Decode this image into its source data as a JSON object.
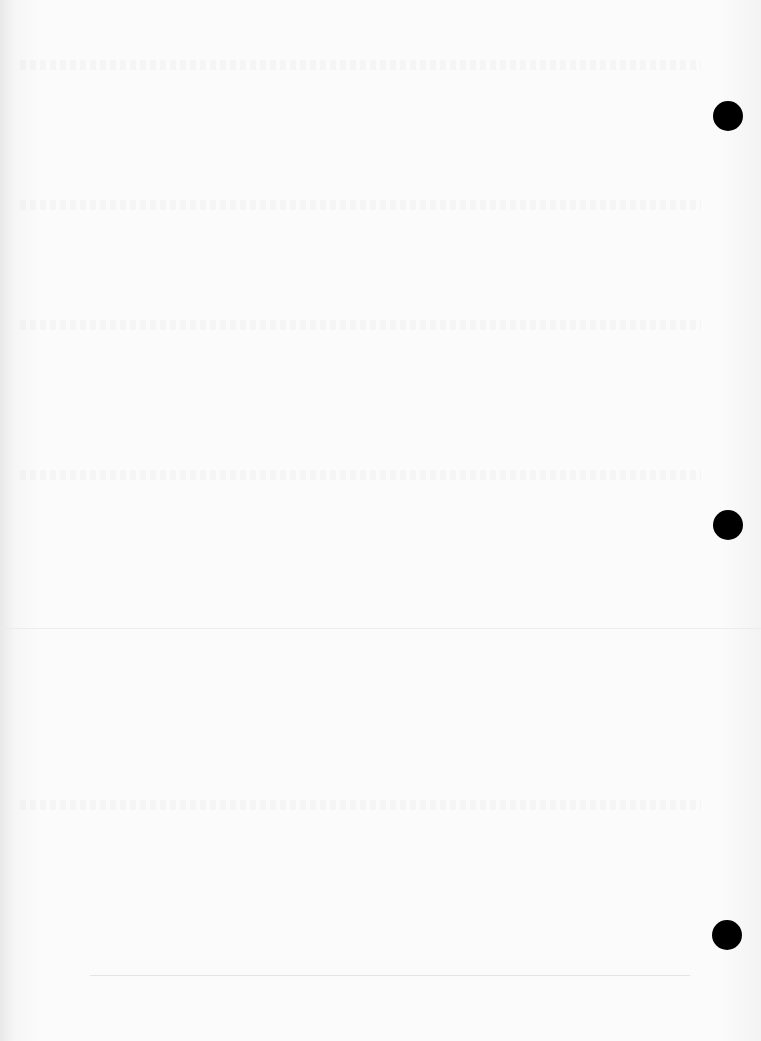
{
  "page": {
    "type": "blank scanned page",
    "visible_text": "",
    "punch_holes": [
      {
        "x": 728,
        "y": 116
      },
      {
        "x": 728,
        "y": 525
      },
      {
        "x": 727,
        "y": 935
      }
    ],
    "colors": {
      "paper": "#fbfbfb",
      "hole": "#000000"
    }
  }
}
